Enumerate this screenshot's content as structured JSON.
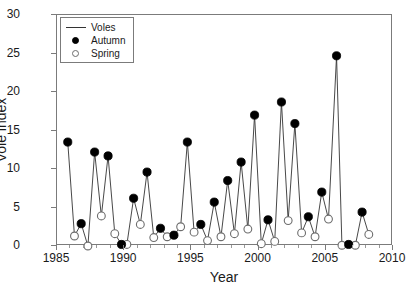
{
  "figure": {
    "cut_off_title": "",
    "background_color": "#ffffff",
    "axis_color": "#7b7b7b",
    "line_color": "#333333",
    "autumn_color": "#000000",
    "spring_color": "#ffffff",
    "spring_edge_color": "#6d6d6d"
  },
  "legend": {
    "position": "top-left inside axes",
    "entries": [
      {
        "label": "Voles",
        "key": "line-key-icon"
      },
      {
        "label": "Autumn",
        "key": "filled-circle-key-icon"
      },
      {
        "label": "Spring",
        "key": "open-circle-key-icon"
      }
    ]
  },
  "chart_data": {
    "type": "line",
    "title": "",
    "xlabel": "Year",
    "ylabel": "Vole index",
    "xlim": [
      1985,
      2010
    ],
    "ylim": [
      0,
      30
    ],
    "xticks": [
      1985,
      1990,
      1995,
      2000,
      2005,
      2010
    ],
    "yticks": [
      0,
      5,
      10,
      15,
      20,
      25,
      30
    ],
    "xtick_minor_step": 1,
    "grid": false,
    "legend_entries": [
      "Voles",
      "Autumn",
      "Spring"
    ],
    "series": [
      {
        "name": "Autumn",
        "marker": "filled-circle",
        "points": [
          {
            "x": 1985.8,
            "y": 13.5
          },
          {
            "x": 1986.8,
            "y": 2.9
          },
          {
            "x": 1987.8,
            "y": 12.2
          },
          {
            "x": 1988.8,
            "y": 11.7
          },
          {
            "x": 1989.8,
            "y": 0.2
          },
          {
            "x": 1990.7,
            "y": 6.2
          },
          {
            "x": 1991.7,
            "y": 9.6
          },
          {
            "x": 1992.7,
            "y": 2.3
          },
          {
            "x": 1993.7,
            "y": 1.4
          },
          {
            "x": 1994.7,
            "y": 13.5
          },
          {
            "x": 1995.7,
            "y": 2.8
          },
          {
            "x": 1996.7,
            "y": 5.7
          },
          {
            "x": 1997.7,
            "y": 8.5
          },
          {
            "x": 1998.7,
            "y": 10.9
          },
          {
            "x": 1999.7,
            "y": 17.0
          },
          {
            "x": 2000.7,
            "y": 3.4
          },
          {
            "x": 2001.7,
            "y": 18.7
          },
          {
            "x": 2002.7,
            "y": 15.9
          },
          {
            "x": 2003.7,
            "y": 3.8
          },
          {
            "x": 2004.7,
            "y": 7.0
          },
          {
            "x": 2005.8,
            "y": 24.7
          },
          {
            "x": 2006.7,
            "y": 0.2
          },
          {
            "x": 2007.7,
            "y": 4.4
          }
        ]
      },
      {
        "name": "Spring",
        "marker": "open-circle",
        "points": [
          {
            "x": 1986.3,
            "y": 1.3
          },
          {
            "x": 1987.3,
            "y": 0.0
          },
          {
            "x": 1988.3,
            "y": 3.9
          },
          {
            "x": 1989.3,
            "y": 1.6
          },
          {
            "x": 1990.2,
            "y": 0.2
          },
          {
            "x": 1991.2,
            "y": 2.8
          },
          {
            "x": 1992.2,
            "y": 1.1
          },
          {
            "x": 1993.2,
            "y": 1.2
          },
          {
            "x": 1994.2,
            "y": 2.5
          },
          {
            "x": 1995.2,
            "y": 1.8
          },
          {
            "x": 1996.2,
            "y": 0.7
          },
          {
            "x": 1997.2,
            "y": 1.2
          },
          {
            "x": 1998.2,
            "y": 1.6
          },
          {
            "x": 1999.2,
            "y": 2.2
          },
          {
            "x": 2000.2,
            "y": 0.3
          },
          {
            "x": 2001.2,
            "y": 0.6
          },
          {
            "x": 2002.2,
            "y": 3.3
          },
          {
            "x": 2003.2,
            "y": 1.7
          },
          {
            "x": 2004.2,
            "y": 1.2
          },
          {
            "x": 2005.2,
            "y": 3.5
          },
          {
            "x": 2006.2,
            "y": 0.1
          },
          {
            "x": 2007.2,
            "y": 0.1
          },
          {
            "x": 2008.2,
            "y": 1.5
          }
        ]
      }
    ],
    "combined_sequence_note": "Voles line connects all Autumn and Spring observations in chronological order"
  }
}
